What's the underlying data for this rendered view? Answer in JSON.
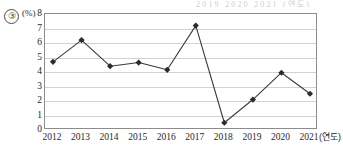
{
  "page": {
    "option_number": "③",
    "bleed_text": "2019   2020   2021 (연도)"
  },
  "chart_data": {
    "type": "line",
    "title": "",
    "subtitle": "",
    "xlabel": "(연도)",
    "ylabel": "(%)",
    "categories": [
      "2012",
      "2013",
      "2014",
      "2015",
      "2016",
      "2017",
      "2018",
      "2019",
      "2020",
      "2021"
    ],
    "values": [
      4.7,
      6.2,
      4.4,
      4.65,
      4.15,
      7.2,
      0.5,
      2.1,
      3.95,
      2.5
    ],
    "series": [
      {
        "name": "",
        "values": [
          4.7,
          6.2,
          4.4,
          4.65,
          4.15,
          7.2,
          0.5,
          2.1,
          3.95,
          2.5
        ]
      }
    ],
    "ylim": [
      0,
      8
    ],
    "yticks": [
      0,
      1,
      2,
      3,
      4,
      5,
      6,
      7,
      8
    ],
    "ytick_labels": [
      "0",
      "1",
      "2",
      "3",
      "4",
      "5",
      "6",
      "7",
      "8"
    ],
    "grid": true,
    "grid_axis": "y",
    "legend": false,
    "legend_position": "none",
    "marker": "diamond",
    "line_color": "#3a3a3a",
    "marker_color": "#2b2b2b",
    "grid_color": "#d2d2d2",
    "frame_color": "#8c8c8c"
  }
}
